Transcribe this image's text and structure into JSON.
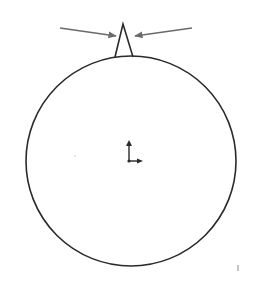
{
  "diagram": {
    "type": "cad-sketch",
    "colors": {
      "stroke": "#2a2a2a",
      "arrow": "#6a6a6a",
      "background": "#ffffff"
    },
    "circle": {
      "cx": 131,
      "cy": 161,
      "r": 105
    },
    "spike": {
      "apex": [
        123,
        24
      ],
      "base_left": [
        115,
        57
      ],
      "base_right": [
        133,
        57
      ]
    },
    "arrows": [
      {
        "from": [
          60,
          28
        ],
        "to": [
          117,
          36
        ],
        "label": ""
      },
      {
        "from": [
          192,
          28
        ],
        "to": [
          134,
          36
        ],
        "label": ""
      }
    ],
    "origin_marker": {
      "x": 129,
      "y": 161
    },
    "labels": []
  }
}
